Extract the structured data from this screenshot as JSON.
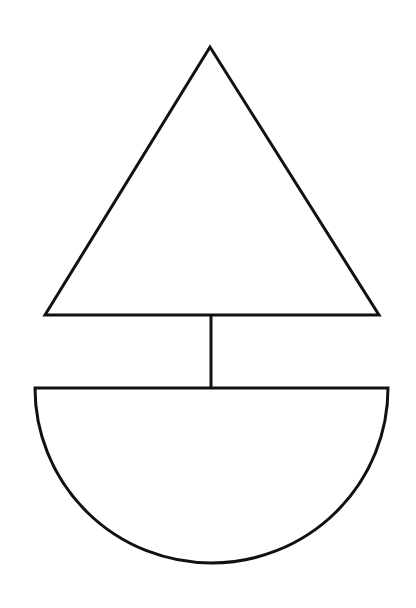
{
  "diagram": {
    "background": "#ffffff",
    "stroke_color": "#111111",
    "stroke_width": 3,
    "shapes": {
      "sail": {
        "type": "triangle",
        "points": [
          [
            210,
            47
          ],
          [
            45,
            315
          ],
          [
            379,
            315
          ]
        ]
      },
      "mast": {
        "type": "line",
        "x1": 211,
        "y1": 315,
        "x2": 211,
        "y2": 388
      },
      "hull": {
        "type": "semicircle",
        "left": 35,
        "right": 388,
        "top": 388,
        "bottom": 563
      }
    }
  }
}
